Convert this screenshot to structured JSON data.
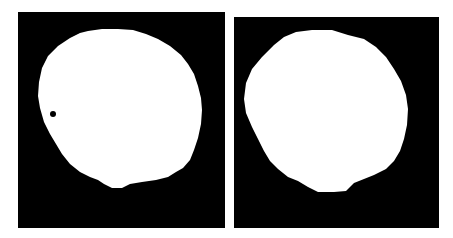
{
  "figure": {
    "background": "#ffffff",
    "panels": [
      {
        "id": "left",
        "description": "binary mask, white elliptical region on black with small dark hole",
        "mask_color": "#ffffff",
        "background_color": "#000000",
        "hole": true
      },
      {
        "id": "right",
        "description": "binary mask, white elliptical region on black",
        "mask_color": "#ffffff",
        "background_color": "#000000",
        "hole": false
      }
    ]
  }
}
